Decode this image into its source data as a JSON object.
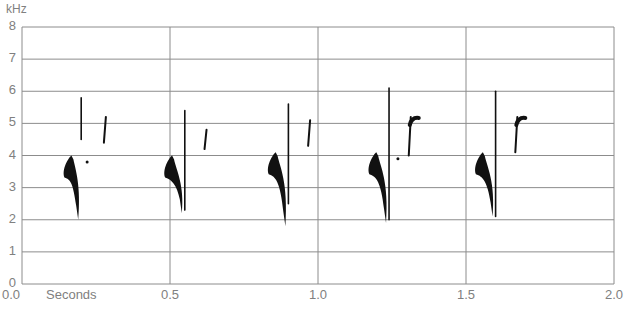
{
  "chart_data": {
    "type": "spectrogram",
    "title": "",
    "xlabel": "Seconds",
    "ylabel": "kHz",
    "xlim": [
      0.0,
      2.0
    ],
    "ylim": [
      0,
      8
    ],
    "x_ticks": [
      "0.0",
      "0.5",
      "1.0",
      "1.5",
      "2.0"
    ],
    "y_ticks": [
      "0",
      "1",
      "2",
      "3",
      "4",
      "5",
      "6",
      "7",
      "8"
    ],
    "grid": {
      "horizontal": true,
      "vertical": true
    },
    "syllables": [
      {
        "index": 1,
        "main_note": {
          "t_start": 0.14,
          "t_end": 0.2,
          "f_high_khz": 4.0,
          "f_low_khz": 2.0
        },
        "upper_notes": [
          {
            "t": 0.2,
            "f_range_khz": [
              4.5,
              5.8
            ]
          },
          {
            "t": 0.28,
            "f_range_khz": [
              4.4,
              5.2
            ]
          }
        ],
        "dot": {
          "t": 0.22,
          "f_khz": 3.8
        }
      },
      {
        "index": 2,
        "main_note": {
          "t_start": 0.48,
          "t_end": 0.55,
          "f_high_khz": 4.0,
          "f_low_khz": 2.2
        },
        "upper_notes": [
          {
            "t": 0.55,
            "f_range_khz": [
              2.3,
              5.4
            ]
          },
          {
            "t": 0.62,
            "f_range_khz": [
              4.2,
              4.8
            ]
          }
        ]
      },
      {
        "index": 3,
        "main_note": {
          "t_start": 0.83,
          "t_end": 0.9,
          "f_high_khz": 4.1,
          "f_low_khz": 1.8
        },
        "upper_notes": [
          {
            "t": 0.9,
            "f_range_khz": [
              2.5,
              5.6
            ]
          },
          {
            "t": 0.97,
            "f_range_khz": [
              4.3,
              5.1
            ]
          }
        ]
      },
      {
        "index": 4,
        "main_note": {
          "t_start": 1.17,
          "t_end": 1.24,
          "f_high_khz": 4.1,
          "f_low_khz": 1.9
        },
        "upper_notes": [
          {
            "t": 1.24,
            "f_range_khz": [
              2.0,
              6.1
            ]
          },
          {
            "t": 1.31,
            "f_range_khz": [
              4.0,
              5.2
            ]
          }
        ],
        "dot": {
          "t": 1.27,
          "f_khz": 3.9
        }
      },
      {
        "index": 5,
        "main_note": {
          "t_start": 1.53,
          "t_end": 1.6,
          "f_high_khz": 4.1,
          "f_low_khz": 2.1
        },
        "upper_notes": [
          {
            "t": 1.6,
            "f_range_khz": [
              2.1,
              6.0
            ]
          },
          {
            "t": 1.67,
            "f_range_khz": [
              4.1,
              5.2
            ]
          }
        ]
      }
    ]
  },
  "axis": {
    "y_unit": "kHz",
    "x_unit": "Seconds",
    "x_tick_labels": [
      "0.0",
      "0.5",
      "1.0",
      "1.5",
      "2.0"
    ],
    "y_tick_labels": [
      "8",
      "7",
      "6",
      "5",
      "4",
      "3",
      "2",
      "1",
      "0"
    ]
  },
  "colors": {
    "grid": "#8c8c8c",
    "ink": "#111111",
    "label": "#808080"
  }
}
